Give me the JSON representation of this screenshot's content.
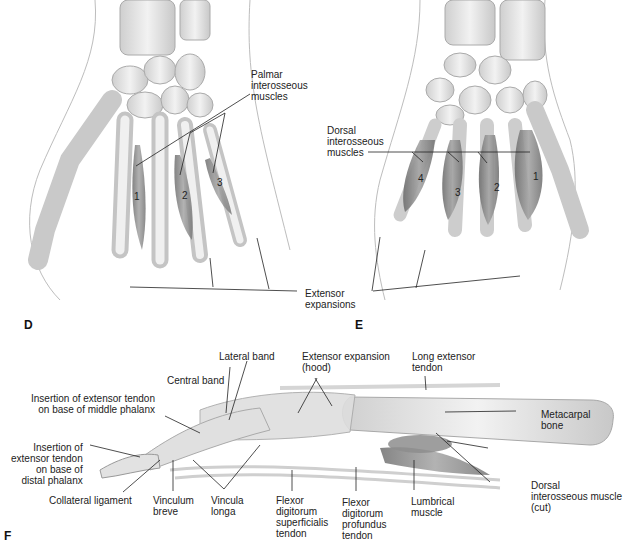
{
  "panels": {
    "D": {
      "letter": "D",
      "view": "palmar",
      "callout": "Palmar\ninterosseous\nmuscles",
      "muscle_numbers": [
        "1",
        "2",
        "3"
      ]
    },
    "E": {
      "letter": "E",
      "view": "dorsal",
      "callout": "Dorsal\ninterosseous\nmuscles",
      "muscle_numbers": [
        "4",
        "3",
        "2",
        "1"
      ]
    },
    "shared": {
      "extensor_expansions": "Extensor\nexpansions"
    },
    "F": {
      "letter": "F",
      "view": "lateral finger",
      "labels": {
        "lateral_band": "Lateral band",
        "central_band": "Central band",
        "extensor_expansion_hood": "Extensor expansion\n(hood)",
        "long_extensor_tendon": "Long extensor\ntendon",
        "insertion_middle": "Insertion of extensor tendon\non base of middle phalanx",
        "insertion_distal": "Insertion of\nextensor tendon\non base of\ndistal phalanx",
        "metacarpal_bone": "Metacarpal\nbone",
        "dorsal_interosseous_cut": "Dorsal\ninterosseous muscle\n(cut)",
        "collateral_ligament": "Collateral ligament",
        "vinculum_breve": "Vinculum\nbreve",
        "vincula_longa": "Vincula\nlonga",
        "fds_tendon": "Flexor\ndigitorum\nsuperficialis\ntendon",
        "fdp_tendon": "Flexor\ndigitorum\nprofundus\ntendon",
        "lumbrical_muscle": "Lumbrical\nmuscle"
      }
    }
  },
  "colors": {
    "bone": "#e6e6e6",
    "bone_edge": "#9a9a9a",
    "muscle": "#8a8a8a",
    "leader": "#222222"
  }
}
